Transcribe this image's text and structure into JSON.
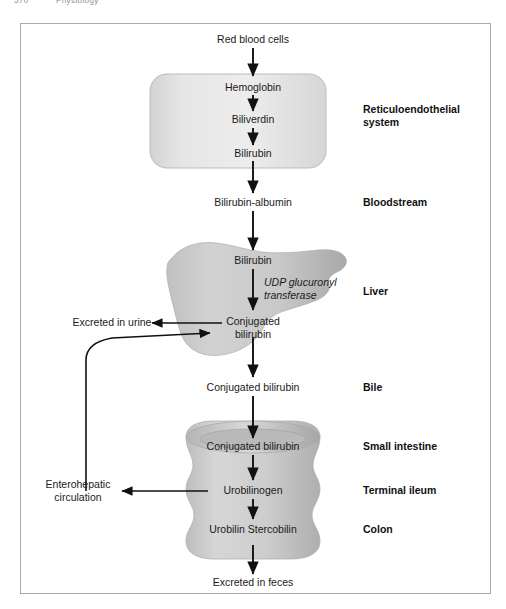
{
  "page_header": {
    "folio": "570",
    "running_head": "Physiology"
  },
  "figure": {
    "type": "flow-diagram",
    "nodes": [
      {
        "id": "rbc",
        "label": "Red blood cells",
        "x": 253,
        "y": 40
      },
      {
        "id": "hemoglobin",
        "label": "Hemoglobin",
        "x": 253,
        "y": 88
      },
      {
        "id": "biliverdin",
        "label": "Biliverdin",
        "x": 253,
        "y": 120
      },
      {
        "id": "bilirubin_res",
        "label": "Bilirubin",
        "x": 253,
        "y": 154
      },
      {
        "id": "bili_albumin",
        "label": "Bilirubin-albumin",
        "x": 253,
        "y": 203
      },
      {
        "id": "bilirubin_liver",
        "label": "Bilirubin",
        "x": 253,
        "y": 261
      },
      {
        "id": "conj_liver",
        "label": "Conjugated\nbilirubin",
        "x": 253,
        "y": 322
      },
      {
        "id": "conj_bile",
        "label": "Conjugated bilirubin",
        "x": 253,
        "y": 388
      },
      {
        "id": "conj_gut",
        "label": "Conjugated bilirubin",
        "x": 253,
        "y": 447
      },
      {
        "id": "urobilinogen",
        "label": "Urobilinogen",
        "x": 253,
        "y": 491
      },
      {
        "id": "urobilin",
        "label": "Urobilin\nStercobilin",
        "x": 253,
        "y": 530
      },
      {
        "id": "feces",
        "label": "Excreted in feces",
        "x": 253,
        "y": 583
      }
    ],
    "enzyme": {
      "label": "UDP glucuronyl\ntransferase",
      "x": 264,
      "y": 283
    },
    "side_outputs": [
      {
        "id": "urine",
        "label": "Excreted in urine",
        "x": 112,
        "y": 323
      },
      {
        "id": "enterohepatic",
        "label": "Enterohepatic\ncirculation",
        "x": 78,
        "y": 485
      }
    ],
    "region_labels": [
      {
        "id": "res",
        "label": "Reticuloendothelial\nsystem",
        "x": 363,
        "y": 110
      },
      {
        "id": "bloodstream",
        "label": "Bloodstream",
        "x": 363,
        "y": 203
      },
      {
        "id": "liver",
        "label": "Liver",
        "x": 363,
        "y": 292
      },
      {
        "id": "bile",
        "label": "Bile",
        "x": 363,
        "y": 388
      },
      {
        "id": "small_intestine",
        "label": "Small intestine",
        "x": 363,
        "y": 447
      },
      {
        "id": "terminal_ileum",
        "label": "Terminal ileum",
        "x": 363,
        "y": 491
      },
      {
        "id": "colon",
        "label": "Colon",
        "x": 363,
        "y": 530
      }
    ],
    "colors": {
      "frame_border": "#a9a9a9",
      "organ_fill_light": "#dcdcdc",
      "organ_fill_mid": "#c8c8c8",
      "organ_fill_dark": "#b0b0b0",
      "arrow": "#111111",
      "text": "#1a1a1a"
    }
  }
}
